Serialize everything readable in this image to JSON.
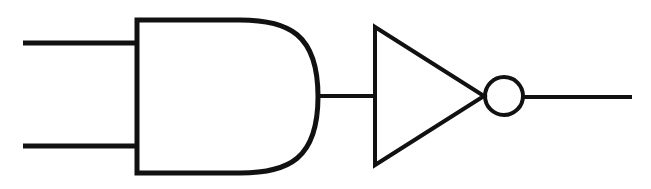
{
  "canvas": {
    "width": 651,
    "height": 189,
    "background_color": "#ffffff",
    "ink_color": "#111111"
  },
  "diagram": {
    "kind": "logic-circuit-schematic",
    "title": "AND gate followed by inverter (NOT gate)",
    "function": "NAND",
    "stroke_width": 5,
    "stroke_width_thin": 4,
    "components": [
      {
        "id": "input-wire-a",
        "type": "wire",
        "role": "input",
        "label": "",
        "x1": 23,
        "y1": 43,
        "x2": 139,
        "y2": 43
      },
      {
        "id": "input-wire-b",
        "type": "wire",
        "role": "input",
        "label": "",
        "x1": 23,
        "y1": 146,
        "x2": 139,
        "y2": 146
      },
      {
        "id": "and-gate",
        "type": "and-gate",
        "label": "AND",
        "left": 137,
        "top": 20,
        "bottom": 173,
        "straight_end_x": 240,
        "apex_x": 318,
        "mid_y": 96.5
      },
      {
        "id": "interconnect-wire",
        "type": "wire",
        "role": "interconnect",
        "label": "",
        "x1": 316,
        "y1": 96,
        "x2": 377,
        "y2": 96
      },
      {
        "id": "inverter-triangle",
        "type": "not-gate-triangle",
        "label": "NOT",
        "left": 375,
        "top": 27,
        "bottom": 165,
        "apex_x": 484,
        "mid_y": 96
      },
      {
        "id": "inverter-bubble",
        "type": "inversion-bubble",
        "label": "inversion bubble",
        "cx": 504,
        "cy": 96,
        "r": 19
      },
      {
        "id": "output-wire",
        "type": "wire",
        "role": "output",
        "label": "",
        "x1": 523,
        "y1": 97,
        "x2": 632,
        "y2": 97
      }
    ]
  }
}
